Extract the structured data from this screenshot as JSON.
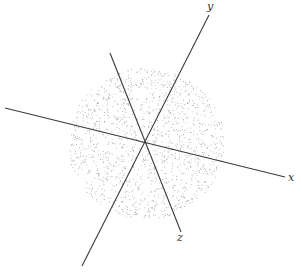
{
  "figure": {
    "width": 302,
    "height": 277,
    "background": "#ffffff",
    "origin": [
      146,
      143
    ],
    "axes": [
      {
        "name": "x",
        "label": "x",
        "from": [
          5,
          108
        ],
        "to": [
          285,
          177
        ],
        "label_pos": [
          291,
          181
        ]
      },
      {
        "name": "y",
        "label": "y",
        "from": [
          82,
          266
        ],
        "to": [
          209,
          15
        ],
        "label_pos": [
          210,
          10
        ]
      },
      {
        "name": "z",
        "label": "z",
        "from": [
          110,
          53
        ],
        "to": [
          181,
          232
        ],
        "label_pos": [
          180,
          241
        ]
      }
    ],
    "point_cloud": {
      "center": [
        146,
        143
      ],
      "radius_x": 78,
      "radius_y": 76,
      "count": 1500,
      "dot_color": "#777777",
      "dot_size": 0.8,
      "seed": 7
    },
    "axis_color": "#3a3a3a"
  }
}
